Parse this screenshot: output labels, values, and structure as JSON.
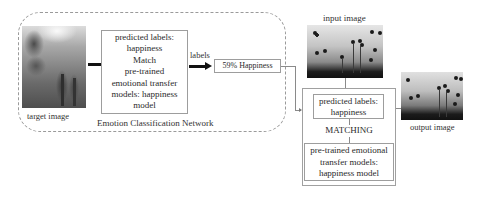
{
  "diagram": {
    "left_section": {
      "container_label": "Emotion Classification Network",
      "target_image_caption": "target image",
      "classification_box_lines": [
        "predicted labels:",
        "happiness",
        "Match",
        "pre-trained",
        "emotional transfer",
        "models: happiness",
        "model"
      ],
      "arrow_label": "labels",
      "result_box": "59% Happiness"
    },
    "right_section": {
      "input_image_caption": "input image",
      "output_image_caption": "output image",
      "predicted_box_lines": [
        "predicted labels:",
        "happiness"
      ],
      "matching_label": "MATCHING",
      "model_box_lines": [
        "pre-trained emotional",
        "transfer models:",
        "happiness model"
      ]
    },
    "colors": {
      "border": "#9d9d9d",
      "dashed_border": "#9a9a9a",
      "arrow": "#111111",
      "text": "#2a2a2a"
    }
  }
}
